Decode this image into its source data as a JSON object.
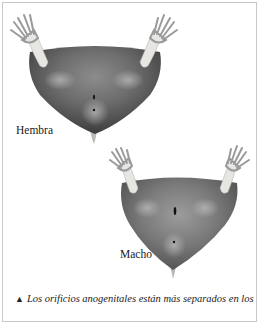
{
  "figure": {
    "labels": {
      "female": "Hembra",
      "male": "Macho"
    },
    "caption": {
      "marker": "▲",
      "text": "Los orificios anogenitales están más separados en los"
    },
    "colors": {
      "fur_dark": "#4a4a4a",
      "fur_light": "#9a9a9a",
      "paw": "#e8e6e2",
      "frame": "#c8c8c8"
    }
  }
}
